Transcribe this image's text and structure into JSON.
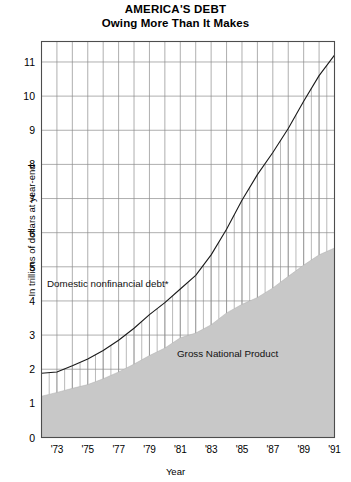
{
  "title": {
    "main": "AMERICA'S DEBT",
    "sub": "Owing More Than It Makes"
  },
  "axes": {
    "ylabel": "In trillions of dollars at year-end",
    "xlabel": "Year"
  },
  "annotations": {
    "debt": "Domestic nonfinancial debt*",
    "gnp": "Gross National Product"
  },
  "colors": {
    "area_fill": "#c8c8c8",
    "line": "#1a1a1a",
    "grid": "#8c8c8c",
    "frame": "#4d4d4d",
    "background": "#ffffff",
    "text": "#000000"
  },
  "chart_data": {
    "type": "area",
    "subtitle": "Owing More Than It Makes",
    "xlabel": "Year",
    "ylabel": "In trillions of dollars at year-end",
    "xlim": [
      1972,
      1991
    ],
    "ylim": [
      0,
      11.6
    ],
    "yticks": [
      0,
      1,
      2,
      3,
      4,
      5,
      6,
      7,
      8,
      9,
      10,
      11
    ],
    "ytick_labels": [
      "0",
      "1",
      "2",
      "3",
      "4",
      "5",
      "6",
      "7",
      "8",
      "9",
      "10",
      "11"
    ],
    "xticks": [
      1973,
      1975,
      1977,
      1979,
      1981,
      1983,
      1985,
      1987,
      1989,
      1991
    ],
    "xtick_labels": [
      "'73",
      "'75",
      "'77",
      "'79",
      "'81",
      "'83",
      "'85",
      "'87",
      "'89",
      "'91"
    ],
    "grid": "both",
    "grid_x_interval": 1,
    "grid_y_interval": 1,
    "legend": "inline-annotations",
    "x": [
      1972,
      1973,
      1974,
      1975,
      1976,
      1977,
      1978,
      1979,
      1980,
      1981,
      1982,
      1983,
      1984,
      1985,
      1986,
      1987,
      1988,
      1989,
      1990,
      1991
    ],
    "series": [
      {
        "name": "Domestic nonfinancial debt*",
        "style": "line",
        "values": [
          1.88,
          1.92,
          2.1,
          2.3,
          2.55,
          2.85,
          3.2,
          3.6,
          3.95,
          4.35,
          4.75,
          5.35,
          6.1,
          6.95,
          7.7,
          8.35,
          9.05,
          9.85,
          10.6,
          11.2
        ]
      },
      {
        "name": "Gross National Product",
        "style": "filled-area",
        "values": [
          1.21,
          1.32,
          1.44,
          1.55,
          1.72,
          1.92,
          2.15,
          2.4,
          2.62,
          2.92,
          3.06,
          3.3,
          3.65,
          3.9,
          4.1,
          4.38,
          4.72,
          5.05,
          5.35,
          5.55
        ]
      }
    ],
    "hatching": {
      "description": "vertical hatch lines in gap between debt line and GNP area",
      "interval_years": 0.5
    }
  }
}
